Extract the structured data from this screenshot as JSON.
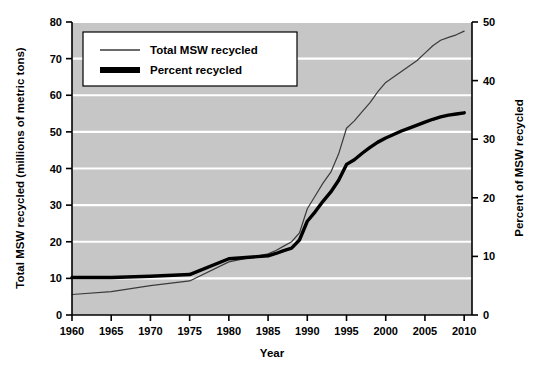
{
  "chart_data": {
    "type": "line",
    "title": "",
    "xlabel": "Year",
    "ylabel": "Total MSW recycled (millions of metric tons)",
    "y2label": "Percent of MSW recycled",
    "xlim": [
      1960,
      2011
    ],
    "ylim": [
      0,
      80
    ],
    "y2lim": [
      0,
      50
    ],
    "xticks": [
      1960,
      1965,
      1970,
      1975,
      1980,
      1985,
      1990,
      1995,
      2000,
      2005,
      2010
    ],
    "xtick_labels": [
      "1960",
      "1965",
      "1970",
      "1975",
      "1980",
      "1985",
      "1990",
      "1995",
      "2000",
      "2005",
      "2010"
    ],
    "yticks": [
      0,
      10,
      20,
      30,
      40,
      50,
      60,
      70,
      80
    ],
    "ytick_labels": [
      "0",
      "10",
      "20",
      "30",
      "40",
      "50",
      "60",
      "70",
      "80"
    ],
    "y2ticks": [
      0,
      10,
      20,
      30,
      40,
      50
    ],
    "y2tick_labels": [
      "0",
      "10",
      "20",
      "30",
      "40",
      "50"
    ],
    "grid": true,
    "grid_color": "#ffffff",
    "plot_background": "#c6c6c6",
    "figure_background": "#ffffff",
    "legend_position": "top-left-inside",
    "series": [
      {
        "name": "Total MSW recycled",
        "axis": "left",
        "units": "millions of metric tons",
        "color": "#3a3a3a",
        "line_width": 1.2,
        "x": [
          1960,
          1965,
          1970,
          1975,
          1980,
          1985,
          1986,
          1987,
          1988,
          1989,
          1990,
          1991,
          1992,
          1993,
          1994,
          1995,
          1996,
          1997,
          1998,
          1999,
          2000,
          2001,
          2002,
          2003,
          2004,
          2005,
          2006,
          2007,
          2008,
          2009,
          2010
        ],
        "values": [
          5.6,
          6.4,
          8.0,
          9.3,
          14.5,
          16.7,
          17.6,
          18.8,
          20.0,
          22.4,
          29.0,
          32.5,
          36.0,
          39.0,
          44.0,
          51.0,
          53.0,
          55.5,
          58.0,
          61.0,
          63.5,
          65.0,
          66.5,
          68.0,
          69.5,
          71.5,
          73.5,
          75.0,
          75.8,
          76.5,
          77.5
        ]
      },
      {
        "name": "Percent recycled",
        "axis": "right",
        "units": "percent",
        "color": "#000000",
        "line_width": 3.4,
        "x": [
          1960,
          1965,
          1970,
          1975,
          1980,
          1985,
          1986,
          1987,
          1988,
          1989,
          1990,
          1991,
          1992,
          1993,
          1994,
          1995,
          1996,
          1997,
          1998,
          1999,
          2000,
          2001,
          2002,
          2003,
          2004,
          2005,
          2006,
          2007,
          2008,
          2009,
          2010
        ],
        "values": [
          6.4,
          6.4,
          6.6,
          6.9,
          9.6,
          10.1,
          10.5,
          11.0,
          11.4,
          12.8,
          16.0,
          17.6,
          19.4,
          21.0,
          23.0,
          25.7,
          26.5,
          27.6,
          28.6,
          29.5,
          30.2,
          30.8,
          31.4,
          31.9,
          32.4,
          32.9,
          33.4,
          33.8,
          34.1,
          34.3,
          34.5
        ]
      }
    ],
    "legend": [
      {
        "label": "Total MSW recycled",
        "style": "thin-line",
        "color": "#3a3a3a"
      },
      {
        "label": "Percent recycled",
        "style": "thick-line",
        "color": "#000000"
      }
    ]
  }
}
